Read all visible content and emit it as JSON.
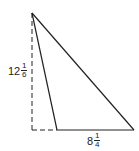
{
  "diagram": {
    "type": "triangle-with-height",
    "height_label": {
      "whole": "12",
      "numerator": "1",
      "denominator": "6"
    },
    "base_label": {
      "whole": "8",
      "numerator": "1",
      "denominator": "4"
    },
    "colors": {
      "line": "#222222",
      "background": "#ffffff"
    }
  }
}
